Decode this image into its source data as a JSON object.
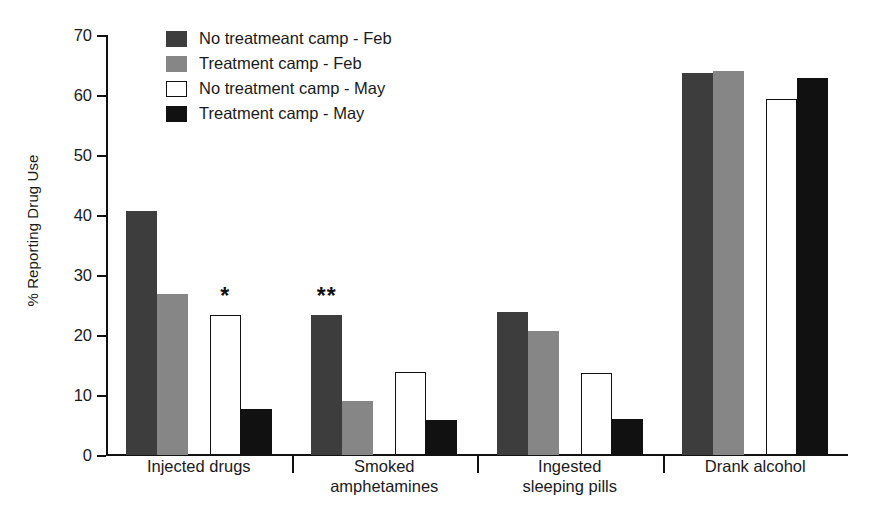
{
  "chart_data": {
    "type": "bar",
    "title": "",
    "xlabel": "",
    "ylabel": "% Reporting Drug Use",
    "ylim": [
      0,
      70
    ],
    "yticks": [
      0,
      10,
      20,
      30,
      40,
      50,
      60,
      70
    ],
    "grid": false,
    "legend_position": "top-left",
    "categories": [
      "Injected drugs",
      "Smoked\namphetamines",
      "Ingested\nsleeping pills",
      "Drank alcohol"
    ],
    "series": [
      {
        "name": "No treatmeant camp - Feb",
        "color": "#3d3d3d",
        "values": [
          40.7,
          23.3,
          23.8,
          63.6
        ]
      },
      {
        "name": "Treatment camp - Feb",
        "color": "#868686",
        "values": [
          26.9,
          9.0,
          20.7,
          64.0
        ]
      },
      {
        "name": "No treatment camp - May",
        "color": "#ffffff",
        "values": [
          23.3,
          13.9,
          13.7,
          59.4
        ]
      },
      {
        "name": "Treatment camp - May",
        "color": "#111111",
        "values": [
          7.6,
          5.9,
          6.0,
          62.8
        ]
      }
    ],
    "annotations": [
      {
        "text": "*",
        "category": "Injected drugs",
        "series": "No treatment camp - May",
        "group_index": 0,
        "bar_index": 2
      },
      {
        "text": "**",
        "category": "Smoked amphetamines",
        "series": "No treatmeant camp - Feb",
        "group_index": 1,
        "bar_index": 0
      }
    ]
  },
  "axis": {
    "y_label": "% Reporting Drug Use",
    "y_tick_labels": [
      "70",
      "60",
      "50",
      "40",
      "30",
      "20",
      "10",
      "0"
    ]
  },
  "legend": {
    "items": [
      {
        "label": "No treatmeant camp - Feb"
      },
      {
        "label": "Treatment camp - Feb"
      },
      {
        "label": "No treatment camp - May"
      },
      {
        "label": "Drank alcohol-placeholder"
      }
    ]
  }
}
